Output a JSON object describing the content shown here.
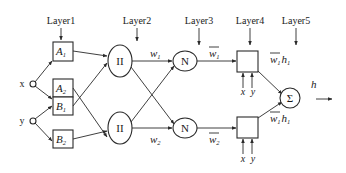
{
  "diagram": {
    "type": "ANFIS architecture",
    "layers": [
      {
        "label": "Layer1"
      },
      {
        "label": "Layer2"
      },
      {
        "label": "Layer3"
      },
      {
        "label": "Layer4"
      },
      {
        "label": "Layer5"
      }
    ],
    "inputs": [
      {
        "label": "x"
      },
      {
        "label": "y"
      }
    ],
    "layer1_nodes": [
      {
        "base": "A",
        "sub": "1"
      },
      {
        "base": "A",
        "sub": "2"
      },
      {
        "base": "B",
        "sub": "1"
      },
      {
        "base": "B",
        "sub": "2"
      }
    ],
    "layer2_nodes": [
      {
        "label": "II"
      },
      {
        "label": "II"
      }
    ],
    "layer2_outputs": [
      {
        "base": "w",
        "sub": "1"
      },
      {
        "base": "w",
        "sub": "2"
      }
    ],
    "layer3_nodes": [
      {
        "label": "N"
      },
      {
        "label": "N"
      }
    ],
    "layer3_outputs": [
      {
        "base": "w",
        "sub": "1",
        "overline": true
      },
      {
        "base": "w",
        "sub": "2",
        "overline": true
      }
    ],
    "layer4_inputs": [
      {
        "x": "x",
        "y": "y"
      },
      {
        "x": "x",
        "y": "y"
      }
    ],
    "layer4_outputs": [
      {
        "base": "w",
        "sub": "1",
        "h": "h",
        "hsub": "1"
      },
      {
        "base": "w",
        "sub": "1",
        "h": "h",
        "hsub": "1"
      }
    ],
    "layer5_node": {
      "label": "Σ"
    },
    "output": {
      "label": "h"
    }
  }
}
